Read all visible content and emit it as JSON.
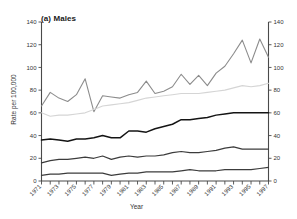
{
  "chart_data": {
    "type": "line",
    "title": "(a) Males",
    "xlabel": "Year",
    "ylabel": "Rate per 100,000",
    "ylim": [
      0,
      140
    ],
    "xlim": [
      1971,
      1997
    ],
    "yticks": [
      0,
      20,
      40,
      60,
      80,
      100,
      120,
      140
    ],
    "ytick_labels": [
      "0",
      "20",
      "40",
      "60",
      "80",
      "100",
      "120",
      "140"
    ],
    "right_axis": true,
    "right_ytick_labels": [
      "0",
      "20",
      "40",
      "60",
      "80",
      "100",
      "120",
      "140"
    ],
    "grid": false,
    "legend": "none",
    "x": [
      1971,
      1972,
      1973,
      1974,
      1975,
      1976,
      1977,
      1978,
      1979,
      1980,
      1981,
      1982,
      1983,
      1984,
      1985,
      1986,
      1987,
      1988,
      1989,
      1990,
      1991,
      1992,
      1993,
      1994,
      1995,
      1996,
      1997
    ],
    "xtick_labels": [
      "1971",
      "1973",
      "1975",
      "1977",
      "1979",
      "1981",
      "1983",
      "1985",
      "1987",
      "1989",
      "1991",
      "1993",
      "1995",
      "1997"
    ],
    "series": [
      {
        "name": "series-1",
        "color": "#8c8c8c",
        "width": 1.1,
        "values": [
          66,
          78,
          73,
          70,
          76,
          90,
          61,
          75,
          74,
          73,
          76,
          78,
          88,
          77,
          79,
          83,
          94,
          85,
          93,
          84,
          95,
          101,
          112,
          124,
          104,
          125,
          109
        ]
      },
      {
        "name": "series-2",
        "color": "#d5d5d5",
        "width": 1.1,
        "values": [
          60,
          57,
          58,
          58,
          59,
          60,
          63,
          66,
          67,
          68,
          69,
          71,
          73,
          74,
          75,
          76,
          77,
          77,
          77,
          78,
          79,
          80,
          82,
          84,
          83,
          84,
          86
        ]
      },
      {
        "name": "series-3",
        "color": "#141414",
        "width": 1.5,
        "values": [
          36,
          37,
          36,
          35,
          37,
          37,
          38,
          40,
          38,
          38,
          44,
          44,
          43,
          46,
          48,
          50,
          54,
          54,
          55,
          56,
          58,
          59,
          60,
          60,
          60,
          60,
          60
        ]
      },
      {
        "name": "series-4",
        "color": "#3c3c3c",
        "width": 1.2,
        "values": [
          16,
          18,
          19,
          19,
          20,
          21,
          20,
          22,
          19,
          21,
          22,
          21,
          22,
          22,
          23,
          25,
          26,
          25,
          25,
          26,
          27,
          29,
          30,
          28,
          28,
          28,
          28
        ]
      },
      {
        "name": "series-5",
        "color": "#3c3c3c",
        "width": 1.2,
        "values": [
          5,
          6,
          6,
          7,
          7,
          7,
          7,
          7,
          5,
          6,
          7,
          7,
          8,
          8,
          8,
          8,
          9,
          10,
          9,
          9,
          9,
          10,
          10,
          10,
          10,
          11,
          12
        ]
      }
    ]
  }
}
